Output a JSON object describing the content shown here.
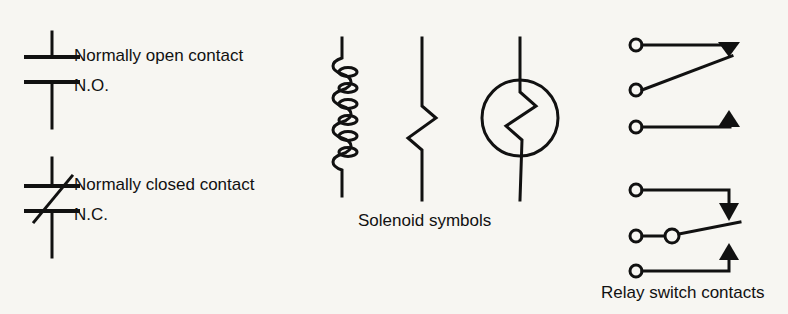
{
  "figure": {
    "background_color": "#f7f6f2",
    "stroke_color": "#111111",
    "groups": [
      {
        "name": "contact-symbols",
        "labels": {
          "normally_open_main": "Normally open contact",
          "normally_open_abbr": "N.O.",
          "normally_closed_main": "Normally closed contact",
          "normally_closed_abbr": "N.C."
        }
      },
      {
        "name": "solenoid-symbols",
        "caption": "Solenoid symbols",
        "variants": [
          "helical-coil",
          "zigzag",
          "zigzag-in-circle"
        ]
      },
      {
        "name": "relay-switch-contacts",
        "caption": "Relay switch contacts",
        "variants": [
          "upper-armature-group",
          "lower-armature-group"
        ]
      }
    ]
  },
  "labels": {
    "normally_open_main": "Normally open contact",
    "normally_open_abbr": "N.O.",
    "normally_closed_main": "Normally closed contact",
    "normally_closed_abbr": "N.C.",
    "solenoid_caption": "Solenoid symbols",
    "relay_caption": "Relay switch contacts"
  }
}
